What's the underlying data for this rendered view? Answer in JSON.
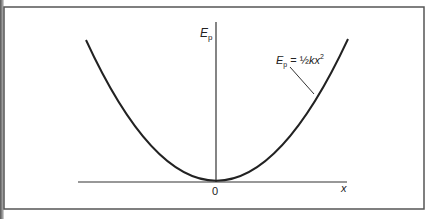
{
  "figure": {
    "y_axis_label": "E",
    "y_axis_label_sub": "p",
    "x_axis_label": "x",
    "origin_label": "0",
    "curve_label": {
      "lhs": "E",
      "lhs_sub": "p",
      "equals": " = ",
      "rhs_frac": "½",
      "rhs_var": "kx",
      "rhs_exp": "2"
    },
    "curve_type": "parabola",
    "colors": {
      "line": "#222222",
      "frame": "#555555",
      "background": "#ffffff"
    }
  }
}
